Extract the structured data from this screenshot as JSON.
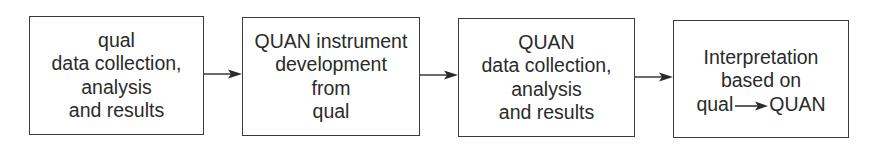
{
  "diagram": {
    "type": "flowchart",
    "direction": "left-to-right",
    "stroke_color": "#3a3a3a",
    "text_color": "#2a2a2a",
    "nodes": [
      {
        "id": "box1",
        "lines": [
          "qual",
          "data collection,",
          "analysis",
          "and results"
        ]
      },
      {
        "id": "box2",
        "lines": [
          "QUAN instrument",
          "development",
          "from",
          "qual"
        ]
      },
      {
        "id": "box3",
        "lines": [
          "QUAN",
          "data collection,",
          "analysis",
          "and results"
        ]
      },
      {
        "id": "box4",
        "lines": [
          "Interpretation",
          "based on"
        ],
        "last_line": {
          "left": "qual",
          "arrow": "→",
          "right": "QUAN"
        }
      }
    ],
    "edges": [
      {
        "from": "box1",
        "to": "box2"
      },
      {
        "from": "box2",
        "to": "box3"
      },
      {
        "from": "box3",
        "to": "box4"
      }
    ]
  }
}
